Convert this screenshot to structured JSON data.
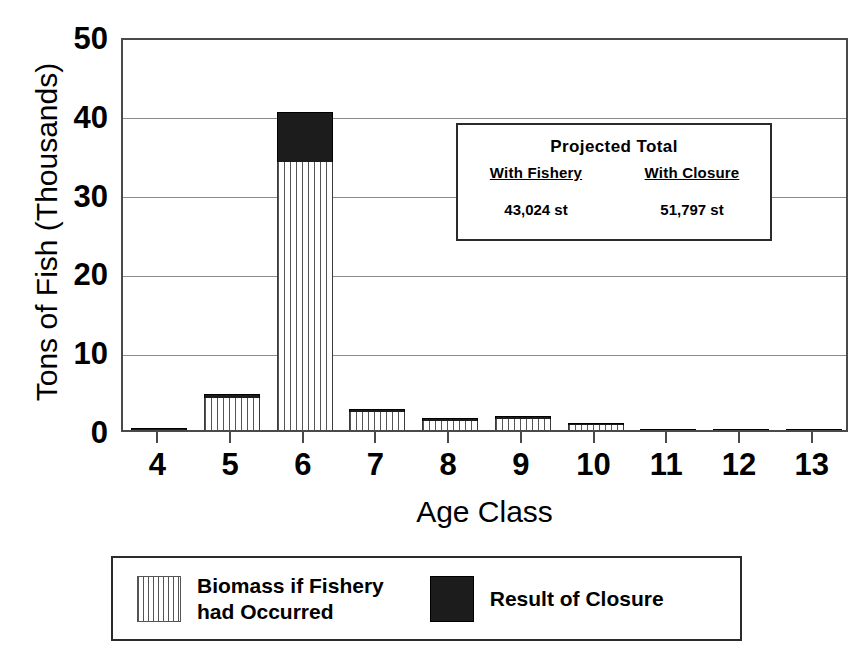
{
  "chart_data": {
    "type": "bar",
    "subtype": "stacked",
    "title": "",
    "xlabel": "Age Class",
    "ylabel": "Tons of Fish (Thousands)",
    "categories": [
      "4",
      "5",
      "6",
      "7",
      "8",
      "9",
      "10",
      "11",
      "12",
      "13"
    ],
    "xtick_labels": [
      "4",
      "5",
      "6",
      "7",
      "8",
      "9",
      "10",
      "11",
      "12",
      "13"
    ],
    "ytick_labels": [
      "0",
      "10",
      "20",
      "30",
      "40",
      "50"
    ],
    "ytick_values": [
      0,
      10,
      20,
      30,
      40,
      50
    ],
    "ylim": [
      0,
      50
    ],
    "grid": "horizontal",
    "legend_position": "below-plot",
    "series": [
      {
        "name": "Biomass if Fishery had Occurred",
        "fill": "vertical-stripes",
        "color": "#ffffff",
        "values": [
          0.0,
          4.0,
          34.0,
          2.3,
          1.3,
          1.5,
          0.75,
          0.0,
          0.0,
          0.0
        ]
      },
      {
        "name": "Result of Closure",
        "fill": "solid",
        "color": "#1c1c1c",
        "values": [
          0.25,
          0.6,
          6.4,
          0.4,
          0.25,
          0.3,
          0.15,
          0.03,
          0.03,
          0.03
        ]
      }
    ],
    "totals": [
      0.25,
      4.6,
      40.4,
      2.7,
      1.55,
      1.8,
      0.9,
      0.03,
      0.03,
      0.03
    ]
  },
  "axes": {
    "ylabel": "Tons of Fish (Thousands)",
    "xlabel": "Age Class",
    "yticks": [
      "50",
      "40",
      "30",
      "20",
      "10",
      "0"
    ],
    "xticks": [
      "4",
      "5",
      "6",
      "7",
      "8",
      "9",
      "10",
      "11",
      "12",
      "13"
    ]
  },
  "inset": {
    "title": "Projected Total",
    "columns": [
      {
        "header": "With Fishery",
        "value": "43,024 st"
      },
      {
        "header": "With Closure",
        "value": "51,797 st"
      }
    ]
  },
  "legend": {
    "entries": [
      {
        "label": "Biomass if Fishery\nhad Occurred",
        "swatch": "striped-swatch"
      },
      {
        "label": "Result of Closure",
        "swatch": "solid-black-swatch"
      }
    ]
  },
  "colors": {
    "closure": "#1c1c1c",
    "fishery_stripe": "#555555",
    "axis": "#4a4a4a",
    "grid": "#8a8a8a",
    "background": "#ffffff"
  }
}
